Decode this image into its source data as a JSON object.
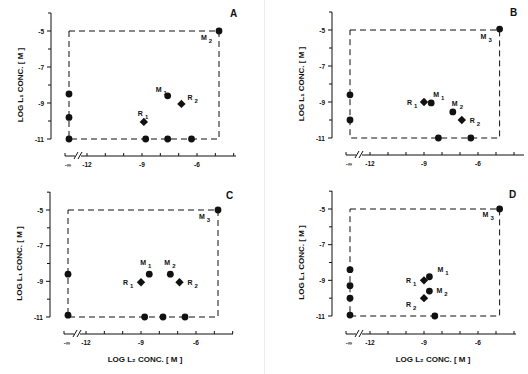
{
  "figure": {
    "y_axis_label": "LOG L₁ CONC. [ M ]",
    "x_axis_label": "LOG L₂ CONC. [ M ]",
    "colors": {
      "ink": "#111111",
      "background": "#ffffff"
    }
  },
  "chart_data": [
    {
      "panel": "A",
      "type": "scatter",
      "title": "A",
      "xlabel": "",
      "ylabel": "LOG L1 CONC. [ M ]",
      "xticks": [
        "-∞",
        "-12",
        "-9",
        "-6"
      ],
      "yticks": [
        "-5",
        "-7",
        "-9",
        "-11"
      ],
      "xlim": [
        -13,
        -3.8
      ],
      "ylim": [
        -11,
        -5
      ],
      "box": {
        "x": [
          -13,
          -4.8
        ],
        "y": [
          -11,
          -5
        ],
        "style": "dashed"
      },
      "points": [
        {
          "x": "-inf",
          "y": -8.5,
          "marker": "circle",
          "label": ""
        },
        {
          "x": "-inf",
          "y": -9.8,
          "marker": "circle",
          "label": ""
        },
        {
          "x": "-inf",
          "y": -11,
          "marker": "circle",
          "label": ""
        },
        {
          "x": -8.8,
          "y": -11,
          "marker": "circle",
          "label": ""
        },
        {
          "x": -7.6,
          "y": -11,
          "marker": "circle",
          "label": ""
        },
        {
          "x": -6.3,
          "y": -11,
          "marker": "circle",
          "label": ""
        },
        {
          "x": -7.6,
          "y": -8.6,
          "marker": "circle",
          "label": "M1"
        },
        {
          "x": -6.85,
          "y": -9.05,
          "marker": "diamond",
          "label": "R2"
        },
        {
          "x": -8.9,
          "y": -10.05,
          "marker": "diamond",
          "label": "R1"
        },
        {
          "x": -4.8,
          "y": -5,
          "marker": "circle",
          "label": "M2"
        }
      ]
    },
    {
      "panel": "B",
      "type": "scatter",
      "title": "B",
      "xlabel": "",
      "ylabel": "LOG L1 CONC. [ M ]",
      "xticks": [
        "-∞",
        "-12",
        "-9",
        "-6"
      ],
      "yticks": [
        "-5",
        "-7",
        "-9",
        "-11"
      ],
      "xlim": [
        -13,
        -3.8
      ],
      "ylim": [
        -11,
        -5
      ],
      "box": {
        "x": [
          -13,
          -4.8
        ],
        "y": [
          -11,
          -5
        ],
        "style": "dashed"
      },
      "points": [
        {
          "x": "-inf",
          "y": -8.6,
          "marker": "circle",
          "label": ""
        },
        {
          "x": "-inf",
          "y": -10,
          "marker": "circle",
          "label": ""
        },
        {
          "x": -8.2,
          "y": -11,
          "marker": "circle",
          "label": ""
        },
        {
          "x": -6.4,
          "y": -11,
          "marker": "circle",
          "label": ""
        },
        {
          "x": -9.0,
          "y": -9.0,
          "marker": "diamond",
          "label": "R1"
        },
        {
          "x": -8.6,
          "y": -9.05,
          "marker": "circle",
          "label": "M1"
        },
        {
          "x": -7.4,
          "y": -9.55,
          "marker": "circle",
          "label": "M2"
        },
        {
          "x": -6.9,
          "y": -10.0,
          "marker": "diamond",
          "label": "R2"
        },
        {
          "x": -4.8,
          "y": -4.95,
          "marker": "circle",
          "label": "M3"
        }
      ]
    },
    {
      "panel": "C",
      "type": "scatter",
      "title": "C",
      "xlabel": "LOG L2 CONC. [ M ]",
      "ylabel": "LOG L1 CONC. [ M ]",
      "xticks": [
        "-∞",
        "-12",
        "-9",
        "-6"
      ],
      "yticks": [
        "-5",
        "-7",
        "-9",
        "-11"
      ],
      "xlim": [
        -13,
        -3.8
      ],
      "ylim": [
        -11,
        -5
      ],
      "box": {
        "x": [
          -13,
          -4.8
        ],
        "y": [
          -11,
          -5
        ],
        "style": "dashed"
      },
      "points": [
        {
          "x": "-inf",
          "y": -8.6,
          "marker": "circle",
          "label": ""
        },
        {
          "x": "-inf",
          "y": -10.9,
          "marker": "circle",
          "label": ""
        },
        {
          "x": -8.8,
          "y": -11,
          "marker": "circle",
          "label": ""
        },
        {
          "x": -7.8,
          "y": -11,
          "marker": "circle",
          "label": ""
        },
        {
          "x": -6.6,
          "y": -11,
          "marker": "circle",
          "label": ""
        },
        {
          "x": -9.0,
          "y": -9.05,
          "marker": "diamond",
          "label": "R1"
        },
        {
          "x": -8.55,
          "y": -8.6,
          "marker": "circle",
          "label": "M1"
        },
        {
          "x": -7.4,
          "y": -8.6,
          "marker": "circle",
          "label": "M2"
        },
        {
          "x": -6.9,
          "y": -9.05,
          "marker": "diamond",
          "label": "R2"
        },
        {
          "x": -4.8,
          "y": -5,
          "marker": "circle",
          "label": "M3"
        }
      ]
    },
    {
      "panel": "D",
      "type": "scatter",
      "title": "D",
      "xlabel": "LOG L2 CONC. [ M ]",
      "ylabel": "LOG L1 CONC. [ M ]",
      "xticks": [
        "-∞",
        "-12",
        "-9",
        "-6"
      ],
      "yticks": [
        "-5",
        "-7",
        "-9",
        "-11"
      ],
      "xlim": [
        -13,
        -3.8
      ],
      "ylim": [
        -11,
        -5
      ],
      "box": {
        "x": [
          -13,
          -4.8
        ],
        "y": [
          -11,
          -5
        ],
        "style": "dashed"
      },
      "points": [
        {
          "x": "-inf",
          "y": -8.4,
          "marker": "circle",
          "label": ""
        },
        {
          "x": "-inf",
          "y": -9.3,
          "marker": "circle",
          "label": ""
        },
        {
          "x": "-inf",
          "y": -10.0,
          "marker": "circle",
          "label": ""
        },
        {
          "x": "-inf",
          "y": -10.95,
          "marker": "circle",
          "label": ""
        },
        {
          "x": -8.4,
          "y": -11,
          "marker": "circle",
          "label": ""
        },
        {
          "x": -9.0,
          "y": -9.0,
          "marker": "diamond",
          "label": "R1"
        },
        {
          "x": -8.7,
          "y": -8.8,
          "marker": "circle",
          "label": "M1"
        },
        {
          "x": -8.7,
          "y": -9.6,
          "marker": "circle",
          "label": "M2"
        },
        {
          "x": -9.0,
          "y": -10.0,
          "marker": "diamond",
          "label": "R2"
        },
        {
          "x": -4.8,
          "y": -5,
          "marker": "circle",
          "label": "M3"
        }
      ]
    }
  ]
}
